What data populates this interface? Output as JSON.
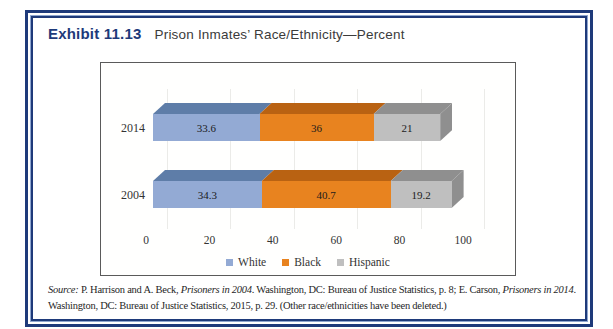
{
  "exhibit": {
    "label": "Exhibit 11.13",
    "title": "Prison Inmates’ Race/Ethnicity—Percent"
  },
  "colors": {
    "frame_navy": "#1e3a7a",
    "chart_border": "#5a5a5a",
    "white_series": "#93aad4",
    "black_series": "#e8831f",
    "hispanic_series": "#bfbfbf"
  },
  "chart_data": {
    "type": "bar",
    "orientation": "horizontal",
    "stacked": true,
    "style": "3d",
    "categories": [
      "2014",
      "2004"
    ],
    "series": [
      {
        "name": "White",
        "color": "#93aad4",
        "dark": "#5e7da8",
        "values": [
          33.6,
          34.3
        ]
      },
      {
        "name": "Black",
        "color": "#e8831f",
        "dark": "#b96212",
        "values": [
          36,
          40.7
        ]
      },
      {
        "name": "Hispanic",
        "color": "#bfbfbf",
        "dark": "#8f8f8f",
        "values": [
          21,
          19.2
        ]
      }
    ],
    "xlim": [
      0,
      100
    ],
    "ticks": [
      0,
      20,
      40,
      60,
      80,
      100
    ],
    "grid": true,
    "legend_position": "bottom",
    "title": "Prison Inmates’ Race/Ethnicity—Percent",
    "xlabel": "",
    "ylabel": ""
  },
  "source": {
    "prefix": "Source:",
    "t1": " P. Harrison and A. Beck, ",
    "i1": "Prisoners in 2004",
    "t2": ". Washington, DC: Bureau of Justice Statistics, p. 8; E. Carson, ",
    "i2": "Prisoners in 2014",
    "t3": ". Washington, DC: Bureau of Justice Statistics, 2015, p. 29. (Other race/ethnicities have been deleted.)"
  }
}
